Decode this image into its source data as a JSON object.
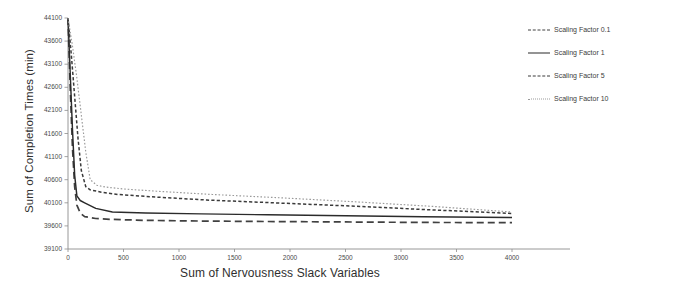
{
  "chart_data": {
    "type": "line",
    "title": "",
    "xlabel": "Sum of Nervousness Slack Variables",
    "ylabel": "Sum of Completion Times (min)",
    "xlim": [
      0,
      4000
    ],
    "ylim": [
      39100,
      44100
    ],
    "xticks": [
      0,
      500,
      1000,
      1500,
      2000,
      2500,
      3000,
      3500,
      4000
    ],
    "yticks": [
      39100,
      39600,
      40100,
      40600,
      41100,
      41600,
      42100,
      42600,
      43100,
      43600,
      44100
    ],
    "grid": false,
    "legend_position": "right",
    "series": [
      {
        "name": "Scaling Factor 0.1",
        "style": "dashed",
        "color": "#404040",
        "x": [
          0,
          20,
          40,
          60,
          80,
          110,
          150,
          250,
          400,
          700,
          1200,
          1800,
          2500,
          3200,
          4000
        ],
        "y": [
          44100,
          42600,
          41300,
          40450,
          40050,
          39880,
          39800,
          39760,
          39740,
          39720,
          39705,
          39695,
          39685,
          39675,
          39670
        ]
      },
      {
        "name": "Scaling Factor 1",
        "style": "solid",
        "color": "#2b2b2b",
        "x": [
          0,
          20,
          40,
          60,
          80,
          110,
          150,
          250,
          400,
          700,
          1200,
          1800,
          2500,
          3200,
          4000
        ],
        "y": [
          44100,
          42900,
          41700,
          40700,
          40250,
          40150,
          40100,
          39980,
          39900,
          39880,
          39860,
          39840,
          39820,
          39800,
          39780
        ]
      },
      {
        "name": "Scaling Factor 5",
        "style": "dashed-short",
        "color": "#3a3a3a",
        "x": [
          0,
          30,
          60,
          90,
          120,
          160,
          200,
          300,
          450,
          750,
          1250,
          1850,
          2550,
          3250,
          4000
        ],
        "y": [
          44100,
          43300,
          42400,
          41500,
          40800,
          40450,
          40380,
          40330,
          40280,
          40230,
          40160,
          40100,
          40030,
          39950,
          39870
        ]
      },
      {
        "name": "Scaling Factor 10",
        "style": "dotted",
        "color": "#9a9a9a",
        "x": [
          0,
          40,
          80,
          120,
          160,
          200,
          260,
          340,
          500,
          800,
          1300,
          1900,
          2600,
          3300,
          4000
        ],
        "y": [
          44100,
          43500,
          42800,
          42000,
          41200,
          40600,
          40480,
          40440,
          40400,
          40350,
          40280,
          40210,
          40120,
          40020,
          39900
        ]
      }
    ]
  },
  "legend": {
    "items": [
      {
        "label": "Scaling Factor 0.1"
      },
      {
        "label": "Scaling Factor 1"
      },
      {
        "label": "Scaling Factor 5"
      },
      {
        "label": "Scaling Factor 10"
      }
    ]
  }
}
